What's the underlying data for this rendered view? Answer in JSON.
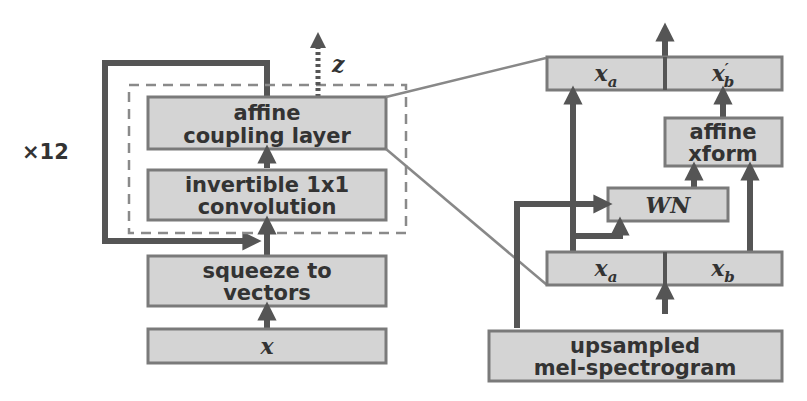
{
  "diagram": {
    "left": {
      "repeat_label": "×12",
      "z_label": "z",
      "blocks": {
        "affine_coupling": [
          "affine",
          "coupling layer"
        ],
        "invertible_conv": [
          "invertible 1x1",
          "convolution"
        ],
        "squeeze": [
          "squeeze to",
          "vectors"
        ],
        "input": "x"
      }
    },
    "right": {
      "output_a": "x_a",
      "output_b": "x'_b",
      "affine_xform": [
        "affine",
        "xform"
      ],
      "wn": "WN",
      "input_a": "x_a",
      "input_b": "x_b",
      "conditioning": [
        "upsampled",
        "mel-spectrogram"
      ]
    },
    "colors": {
      "box_fill": "#d4d4d4",
      "box_stroke": "#7a7a7a",
      "arrow": "#555555",
      "text": "#333333"
    }
  }
}
